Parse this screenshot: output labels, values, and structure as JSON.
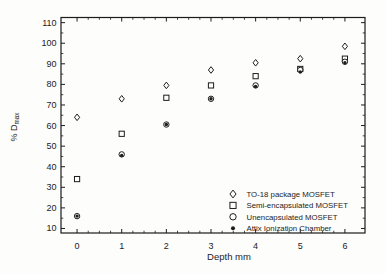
{
  "figure": {
    "background": "#fdfdfc",
    "ink": "#1c1c1c"
  },
  "chart_data": {
    "type": "scatter",
    "title": "",
    "xlabel": "Depth mm",
    "ylabel": "% Dmax",
    "ylabel_prefix": "% D",
    "ylabel_subscript": "max",
    "xlim": [
      -0.36,
      6.45
    ],
    "ylim": [
      7.8,
      112.5
    ],
    "xticks": [
      0,
      1,
      2,
      3,
      4,
      5,
      6
    ],
    "yticks": [
      10,
      20,
      30,
      40,
      50,
      60,
      70,
      80,
      90,
      100,
      110
    ],
    "x_minor_step": 0.25,
    "y_minor_step": 5,
    "grid": false,
    "legend_position": "lower right",
    "x": [
      0,
      1,
      2,
      3,
      4,
      5,
      6
    ],
    "series": [
      {
        "name": "TO-18 package MOSFET",
        "marker": "diamond",
        "filled": false,
        "values": [
          64,
          73,
          79.5,
          87,
          90.5,
          92.5,
          98.5
        ]
      },
      {
        "name": "Semi-encapsulated MOSFET",
        "marker": "square",
        "filled": false,
        "values": [
          34,
          56,
          73.5,
          79.5,
          84,
          87.5,
          92.5
        ]
      },
      {
        "name": "Unencapsulated MOSFET",
        "marker": "circle",
        "filled": false,
        "values": [
          16,
          46,
          60.5,
          73,
          79.5,
          87,
          91
        ]
      },
      {
        "name": "Attix Ionization Chamber",
        "marker": "dot",
        "filled": true,
        "values": [
          16,
          45.5,
          60.5,
          73,
          79,
          86,
          90.5
        ]
      }
    ]
  }
}
